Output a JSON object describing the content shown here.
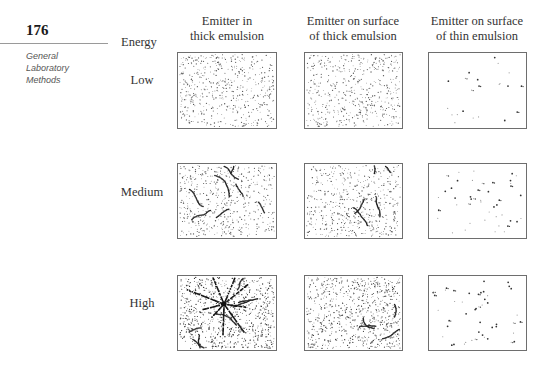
{
  "page": {
    "number": "176",
    "section_label": [
      "General",
      "Laboratory",
      "Methods"
    ]
  },
  "figure": {
    "row_header": "Energy",
    "columns": [
      {
        "line1": "Emitter in",
        "line2": "thick emulsion",
        "center_x": 227
      },
      {
        "line1": "Emitter on surface",
        "line2": "of thick emulsion",
        "center_x": 353
      },
      {
        "line1": "Emitter on surface",
        "line2": "of thin emulsion",
        "center_x": 477
      }
    ],
    "rows": [
      {
        "label": "Low",
        "label_y": 80,
        "top": 52,
        "height": 77
      },
      {
        "label": "Medium",
        "label_y": 192,
        "top": 163,
        "height": 76
      },
      {
        "label": "High",
        "label_y": 303,
        "top": 275,
        "height": 76
      }
    ],
    "panel_x": [
      177,
      304,
      428
    ],
    "panel_width": [
      100,
      99,
      99
    ],
    "panels": [
      [
        {
          "name": "low-thick-inside",
          "background_dots": 520,
          "dot_color": "#555555",
          "tracks": 0,
          "star": false,
          "sparse_spots": 0
        },
        {
          "name": "low-thick-surface",
          "background_dots": 520,
          "dot_color": "#555555",
          "tracks": 0,
          "star": false,
          "sparse_spots": 0
        },
        {
          "name": "low-thin-surface",
          "background_dots": 0,
          "dot_color": "#555555",
          "tracks": 0,
          "star": false,
          "sparse_spots": 22
        }
      ],
      [
        {
          "name": "medium-thick-inside",
          "background_dots": 520,
          "dot_color": "#555555",
          "tracks": 8,
          "star": false,
          "sparse_spots": 0
        },
        {
          "name": "medium-thick-surface",
          "background_dots": 520,
          "dot_color": "#555555",
          "tracks": 5,
          "star": false,
          "sparse_spots": 0
        },
        {
          "name": "medium-thin-surface",
          "background_dots": 0,
          "dot_color": "#555555",
          "tracks": 0,
          "star": false,
          "sparse_spots": 45
        }
      ],
      [
        {
          "name": "high-thick-inside",
          "background_dots": 800,
          "dot_color": "#333333",
          "tracks": 7,
          "star": true,
          "sparse_spots": 0
        },
        {
          "name": "high-thick-surface",
          "background_dots": 750,
          "dot_color": "#444444",
          "tracks": 4,
          "star": false,
          "sparse_spots": 0
        },
        {
          "name": "high-thin-surface",
          "background_dots": 0,
          "dot_color": "#555555",
          "tracks": 0,
          "star": false,
          "sparse_spots": 48
        }
      ]
    ]
  }
}
